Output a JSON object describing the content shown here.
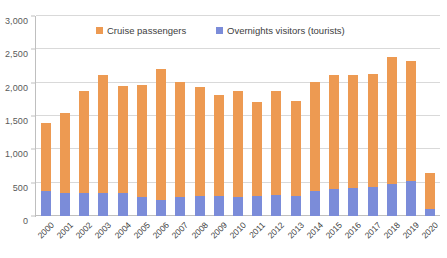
{
  "chart": {
    "type": "bar",
    "title": "",
    "xlabel": "",
    "ylabel": ""
  },
  "legend": {
    "position": "top-center",
    "items": [
      {
        "label": "Cruise passengers",
        "color": "#ED9A52"
      },
      {
        "label": "Overnights visitors (tourists)",
        "color": "#7B8CD9"
      }
    ]
  },
  "yaxis": {
    "min": 0,
    "max": 3000,
    "step": 500,
    "ticks": [
      "0",
      "500",
      "1,000",
      "1,500",
      "2,000",
      "2,500",
      "3,000"
    ],
    "tick_values": [
      0,
      500,
      1000,
      1500,
      2000,
      2500,
      3000
    ]
  },
  "chart_data": {
    "type": "bar",
    "stacked": true,
    "title": "",
    "xlabel": "",
    "ylabel": "",
    "ylim": [
      0,
      3000
    ],
    "ytick_step": 500,
    "grid": true,
    "legend_position": "top-center",
    "categories": [
      "2000",
      "2001",
      "2002",
      "2003",
      "2004",
      "2005",
      "2006",
      "2007",
      "2008",
      "2009",
      "2010",
      "2011",
      "2012",
      "2013",
      "2014",
      "2015",
      "2016",
      "2017",
      "2018",
      "2019",
      "2020"
    ],
    "series": [
      {
        "name": "Overnights visitors (tourists)",
        "color": "#7B8CD9",
        "values": [
          370,
          350,
          345,
          350,
          350,
          290,
          240,
          290,
          300,
          300,
          290,
          300,
          310,
          300,
          370,
          410,
          420,
          440,
          480,
          530,
          110
        ]
      },
      {
        "name": "Cruise passengers",
        "color": "#ED9A52",
        "values": [
          1020,
          1200,
          1530,
          1770,
          1600,
          1680,
          1970,
          1720,
          1640,
          1510,
          1580,
          1410,
          1560,
          1430,
          1640,
          1700,
          1690,
          1690,
          1910,
          1790,
          540
        ]
      }
    ],
    "totals": [
      1390,
      1550,
      1875,
      2120,
      1950,
      1970,
      2210,
      2010,
      1940,
      1810,
      1870,
      1710,
      1870,
      1730,
      2010,
      2110,
      2110,
      2130,
      2390,
      2320,
      650
    ]
  }
}
